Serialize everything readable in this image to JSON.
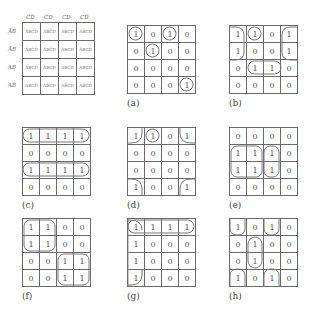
{
  "reference_map": {
    "col_labels": [
      "C̄D̄",
      "C̄D",
      "CD",
      "CD̄"
    ],
    "row_labels": [
      "ĀB̄",
      "ĀB",
      "AB",
      "AB̄"
    ],
    "cells": [
      [
        "ĀB̄C̄D̄",
        "ĀB̄C̄D",
        "ĀB̄CD",
        "ĀB̄CD̄"
      ],
      [
        "ĀBC̄D̄",
        "ĀBC̄D",
        "ĀBCD",
        "ĀBCD̄"
      ],
      [
        "ABC̄D̄",
        "ABC̄D",
        "ABCD",
        "ABCD̄"
      ],
      [
        "AB̄C̄D̄",
        "AB̄C̄D",
        "AB̄CD",
        "AB̄CD̄"
      ]
    ]
  },
  "maps": [
    {
      "caption": "(a)",
      "cells": [
        [
          "1",
          "0",
          "1",
          "0"
        ],
        [
          "0",
          "1",
          "0",
          "0"
        ],
        [
          "0",
          "0",
          "0",
          "0"
        ],
        [
          "0",
          "0",
          "0",
          "1"
        ]
      ]
    },
    {
      "caption": "(b)",
      "cells": [
        [
          "1",
          "1",
          "0",
          "1"
        ],
        [
          "1",
          "0",
          "0",
          "1"
        ],
        [
          "0",
          "1",
          "1",
          "0"
        ],
        [
          "0",
          "0",
          "0",
          "0"
        ]
      ]
    },
    {
      "caption": "(c)",
      "cells": [
        [
          "1",
          "1",
          "1",
          "1"
        ],
        [
          "0",
          "0",
          "0",
          "0"
        ],
        [
          "1",
          "1",
          "1",
          "1"
        ],
        [
          "0",
          "0",
          "0",
          "0"
        ]
      ]
    },
    {
      "caption": "(d)",
      "cells": [
        [
          "1",
          "1",
          "0",
          "1"
        ],
        [
          "0",
          "0",
          "0",
          "0"
        ],
        [
          "0",
          "0",
          "0",
          "0"
        ],
        [
          "1",
          "0",
          "0",
          "1"
        ]
      ]
    },
    {
      "caption": "(e)",
      "cells": [
        [
          "0",
          "0",
          "0",
          "0"
        ],
        [
          "1",
          "1",
          "1",
          "0"
        ],
        [
          "1",
          "1",
          "1",
          "0"
        ],
        [
          "0",
          "0",
          "0",
          "0"
        ]
      ]
    },
    {
      "caption": "(f)",
      "cells": [
        [
          "1",
          "1",
          "0",
          "0"
        ],
        [
          "1",
          "1",
          "0",
          "0"
        ],
        [
          "0",
          "0",
          "1",
          "1"
        ],
        [
          "0",
          "0",
          "1",
          "1"
        ]
      ]
    },
    {
      "caption": "(g)",
      "cells": [
        [
          "1",
          "1",
          "1",
          "1"
        ],
        [
          "1",
          "0",
          "0",
          "0"
        ],
        [
          "1",
          "0",
          "0",
          "0"
        ],
        [
          "1",
          "0",
          "0",
          "0"
        ]
      ]
    },
    {
      "caption": "(h)",
      "cells": [
        [
          "1",
          "0",
          "1",
          "0"
        ],
        [
          "0",
          "1",
          "0",
          "0"
        ],
        [
          "0",
          "1",
          "0",
          "0"
        ],
        [
          "1",
          "0",
          "1",
          "0"
        ]
      ]
    }
  ]
}
